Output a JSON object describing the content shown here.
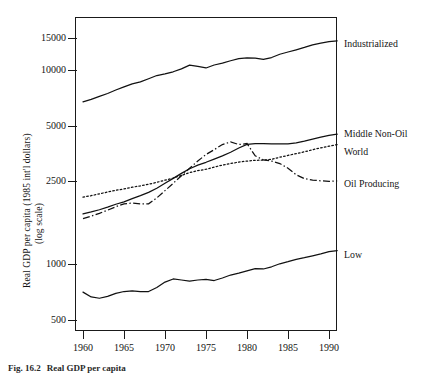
{
  "figure": {
    "caption_number": "Fig. 16.2",
    "caption_text": "Real GDP per capita"
  },
  "axes": {
    "y_title_line1": "Real GDP per capita (1985 int'l dollars)",
    "y_title_line2": "(log scale)",
    "x_title": "",
    "y_ticks": [
      "15000",
      "10000",
      "5000",
      "2500",
      "1000",
      "500"
    ],
    "x_ticks": [
      "1960",
      "1965",
      "1970",
      "1975",
      "1980",
      "1985",
      "1990"
    ]
  },
  "series_labels": {
    "industrialized": "Industrialized",
    "middle_non_oil": "Middle Non-Oil",
    "world": "World",
    "oil_producing": "Oil Producing",
    "low": "Low"
  },
  "chart_data": {
    "type": "line",
    "title": "Real GDP per capita",
    "xlabel": "",
    "ylabel": "Real GDP per capita (1985 int'l dollars) (log scale)",
    "yscale": "log",
    "ylim": [
      400,
      18000
    ],
    "xlim": [
      1960,
      1991
    ],
    "grid": false,
    "legend_position": "right-of-axes-inline",
    "ytick_values": [
      15000,
      10000,
      5000,
      2500,
      1000,
      500
    ],
    "xtick_values": [
      1960,
      1965,
      1970,
      1975,
      1980,
      1985,
      1990
    ],
    "x": [
      1960,
      1961,
      1962,
      1963,
      1964,
      1965,
      1966,
      1967,
      1968,
      1969,
      1970,
      1971,
      1972,
      1973,
      1974,
      1975,
      1976,
      1977,
      1978,
      1979,
      1980,
      1981,
      1982,
      1983,
      1984,
      1985,
      1986,
      1987,
      1988,
      1989,
      1990,
      1991
    ],
    "series": [
      {
        "name": "Industrialized",
        "style": "solid",
        "values": [
          6950,
          7150,
          7420,
          7680,
          8010,
          8320,
          8620,
          8830,
          9180,
          9540,
          9740,
          9980,
          10340,
          10820,
          10640,
          10450,
          10830,
          11080,
          11400,
          11700,
          11800,
          11760,
          11600,
          11850,
          12330,
          12670,
          13010,
          13390,
          13820,
          14100,
          14350,
          14500
        ]
      },
      {
        "name": "Middle Non-Oil",
        "style": "solid",
        "values": [
          1800,
          1840,
          1890,
          1950,
          2020,
          2080,
          2160,
          2240,
          2330,
          2450,
          2600,
          2760,
          2930,
          3100,
          3240,
          3350,
          3480,
          3620,
          3780,
          3980,
          4160,
          4200,
          4190,
          4180,
          4180,
          4180,
          4230,
          4320,
          4430,
          4540,
          4640,
          4700
        ]
      },
      {
        "name": "World",
        "style": "dotted",
        "values": [
          2200,
          2240,
          2290,
          2340,
          2390,
          2430,
          2480,
          2520,
          2570,
          2630,
          2700,
          2770,
          2860,
          2960,
          3030,
          3080,
          3160,
          3240,
          3300,
          3360,
          3400,
          3430,
          3440,
          3470,
          3560,
          3640,
          3720,
          3800,
          3900,
          3990,
          4070,
          4150
        ]
      },
      {
        "name": "Oil Producing",
        "style": "dashdot",
        "values": [
          1700,
          1750,
          1810,
          1880,
          1960,
          2030,
          2050,
          2030,
          2030,
          2180,
          2380,
          2600,
          2850,
          3120,
          3400,
          3680,
          3900,
          4150,
          4280,
          4150,
          4200,
          3620,
          3450,
          3400,
          3300,
          3120,
          2880,
          2750,
          2700,
          2680,
          2660,
          2680
        ]
      },
      {
        "name": "Low",
        "style": "solid",
        "values": [
          700,
          660,
          650,
          665,
          690,
          705,
          710,
          705,
          705,
          740,
          790,
          820,
          810,
          800,
          810,
          815,
          805,
          830,
          860,
          880,
          905,
          930,
          925,
          950,
          985,
          1010,
          1040,
          1060,
          1085,
          1110,
          1140,
          1155
        ]
      }
    ]
  }
}
